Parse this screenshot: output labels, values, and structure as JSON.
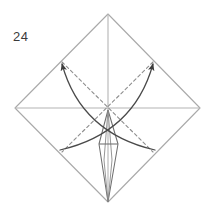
{
  "figure": {
    "step_number": "24",
    "type": "origami-fold-diagram",
    "canvas": {
      "width": 215,
      "height": 216
    },
    "background_color": "#ffffff"
  },
  "colors": {
    "paper_edge": "#a9a9a9",
    "crease_median": "#b4b4b4",
    "dashed_crease": "#8e8e8e",
    "arrow": "#4a4a4a",
    "spindle": "#6e6e6e",
    "label_text": "#3a3a3a"
  },
  "geometry": {
    "vertices": {
      "top": {
        "x": 108,
        "y": 14
      },
      "right": {
        "x": 200,
        "y": 108
      },
      "bottom": {
        "x": 108,
        "y": 202
      },
      "left": {
        "x": 15,
        "y": 108
      },
      "center": {
        "x": 108,
        "y": 110
      }
    },
    "midpoints": {
      "upper_left": {
        "x": 62,
        "y": 62
      },
      "upper_right": {
        "x": 153,
        "y": 62
      },
      "lower_left": {
        "x": 62,
        "y": 152
      },
      "lower_right": {
        "x": 153,
        "y": 152
      }
    },
    "curve_crossing": {
      "x": 108,
      "y": 88
    },
    "spindle": {
      "apex_top": {
        "x": 108,
        "y": 110
      },
      "apex_bottom": {
        "x": 108,
        "y": 202
      },
      "widest_y": 144,
      "left_x": 99,
      "right_x": 118,
      "crossbar_y": 144
    }
  },
  "outline": {
    "name": "paper-diamond-outline",
    "path": "M 108 14 L 200 108 L 108 202 L 15 108 Z"
  },
  "median_creases": [
    {
      "name": "horizontal-median-crease",
      "path": "M 15 108 L 200 108"
    },
    {
      "name": "vertical-median-crease",
      "path": "M 108 14 L 108 202"
    }
  ],
  "dashed_creases": [
    {
      "name": "dashed-crease-nw-se",
      "path": "M 62 62 L 153 152"
    },
    {
      "name": "dashed-crease-ne-sw",
      "path": "M 153 62 L 62 152"
    }
  ],
  "arrows": [
    {
      "name": "fold-arrow-to-upper-left",
      "path": "M 155 150 C 120 142, 78 122, 62 64",
      "head_at": {
        "x": 62,
        "y": 64
      },
      "head_angle_deg": -105
    },
    {
      "name": "fold-arrow-to-upper-right",
      "path": "M 60 150 C 95 142, 137 122, 153 64",
      "head_at": {
        "x": 153,
        "y": 64
      },
      "head_angle_deg": -75
    }
  ],
  "spindle_paths": {
    "left_edge": "M 108 110 L 99 144 L 108 202",
    "right_edge": "M 108 110 L 118 144 L 108 202",
    "crossbar": "M 99 144 L 118 144",
    "inner_left": "M 108 110 L 104 160 L 108 202",
    "inner_right": "M 108 110 L 112 160 L 108 202"
  },
  "label": {
    "name": "step-number",
    "text": "24",
    "x": 13,
    "y": 41
  }
}
